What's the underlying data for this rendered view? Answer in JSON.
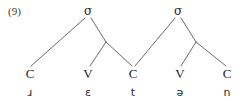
{
  "figure": {
    "example_number": "(9)",
    "transcription": "ɹɛtən",
    "line_color": "#595959",
    "text_color": "#262626",
    "background_color": "#ffffff"
  },
  "syllable_nodes": [
    {
      "label": "σ",
      "name": "sigma-node-1",
      "x": 88,
      "y": 11
    },
    {
      "label": "σ",
      "name": "sigma-node-2",
      "x": 178,
      "y": 11
    }
  ],
  "rime_nodes": [
    {
      "name": "rime-node-1",
      "x": 106,
      "y": 42
    },
    {
      "name": "rime-node-2",
      "x": 196,
      "y": 42
    }
  ],
  "skeletal_tier": [
    {
      "label": "C",
      "name": "skeletal-slot-c1",
      "x": 30,
      "y": 73
    },
    {
      "label": "V",
      "name": "skeletal-slot-v1",
      "x": 88,
      "y": 73
    },
    {
      "label": "C",
      "name": "skeletal-slot-c2",
      "x": 133,
      "y": 73
    },
    {
      "label": "V",
      "name": "skeletal-slot-v2",
      "x": 180,
      "y": 73
    },
    {
      "label": "C",
      "name": "skeletal-slot-c3",
      "x": 227,
      "y": 73
    }
  ],
  "phoneme_tier": [
    {
      "label": "ɹ",
      "name": "phoneme-r",
      "x": 30,
      "y": 92
    },
    {
      "label": "ɛ",
      "name": "phoneme-epsilon",
      "x": 88,
      "y": 92
    },
    {
      "label": "t",
      "name": "phoneme-t",
      "x": 133,
      "y": 92
    },
    {
      "label": "ə",
      "name": "phoneme-schwa",
      "x": 180,
      "y": 92
    },
    {
      "label": "n",
      "name": "phoneme-n",
      "x": 227,
      "y": 92
    }
  ],
  "branches": [
    {
      "name": "branch-sigma1-onset",
      "x1": 85,
      "y1": 18,
      "x2": 31,
      "y2": 66
    },
    {
      "name": "branch-sigma1-rime",
      "x1": 91,
      "y1": 18,
      "x2": 106,
      "y2": 42
    },
    {
      "name": "branch-rime1-nucleus",
      "x1": 106,
      "y1": 42,
      "x2": 90,
      "y2": 66
    },
    {
      "name": "branch-rime1-coda",
      "x1": 106,
      "y1": 42,
      "x2": 132,
      "y2": 66
    },
    {
      "name": "branch-sigma2-onset",
      "x1": 175,
      "y1": 18,
      "x2": 135,
      "y2": 66
    },
    {
      "name": "branch-sigma2-rime",
      "x1": 181,
      "y1": 18,
      "x2": 196,
      "y2": 42
    },
    {
      "name": "branch-rime2-nucleus",
      "x1": 196,
      "y1": 42,
      "x2": 181,
      "y2": 66
    },
    {
      "name": "branch-rime2-coda",
      "x1": 196,
      "y1": 42,
      "x2": 226,
      "y2": 66
    }
  ]
}
